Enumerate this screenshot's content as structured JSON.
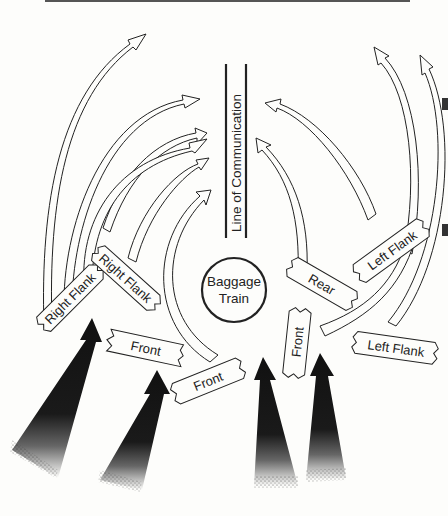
{
  "diagram": {
    "type": "military-maneuver-diagram",
    "center": {
      "label_line1": "Baggage",
      "label_line2": "Train"
    },
    "line_of_communication": {
      "label": "Line of Communication"
    },
    "labels": {
      "right_flank_outer": "Right Flank",
      "right_flank_inner": "Right Flank",
      "front_left": "Front",
      "front_center": "Front",
      "front_vertical": "Front",
      "rear": "Rear",
      "left_flank_upper": "Left Flank",
      "left_flank_lower": "Left Flank"
    },
    "attack_arrows_count": 4,
    "maneuver_arrows_count": 9,
    "colors": {
      "ink": "#222222",
      "background": "#fdfdfb"
    }
  }
}
